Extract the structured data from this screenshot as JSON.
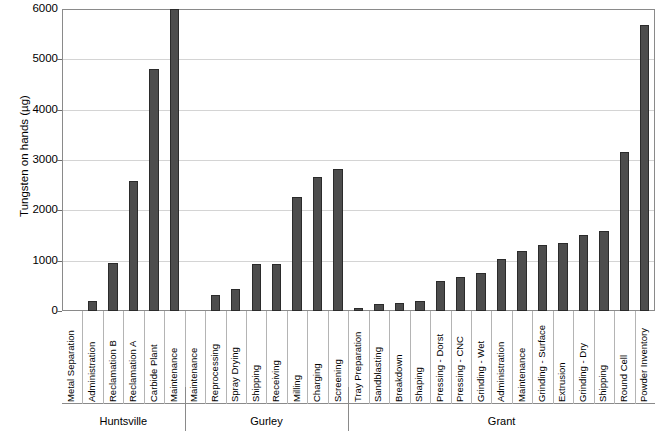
{
  "chart_data": {
    "type": "bar",
    "title": "",
    "xlabel": "",
    "ylabel": "Tungsten on hands (µg)",
    "ylim": [
      0,
      6000
    ],
    "ytick_labels": [
      "6000",
      "5000",
      "4000",
      "3000",
      "2000",
      "1000",
      "0"
    ],
    "ytick_values": [
      6000,
      5000,
      4000,
      3000,
      2000,
      1000,
      0
    ],
    "grid": true,
    "legend": "none",
    "bar_color": "#4d4d4d",
    "bar_edge_color": "#2b2b2b",
    "categories": [
      "Metal Separation",
      "Administration",
      "Reclamation B",
      "Reclamation A",
      "Carbide Plant",
      "Maintenance",
      "Maintenance",
      "Reprocessing",
      "Spray Drying",
      "Shipping",
      "Receiving",
      "Milling",
      "Charging",
      "Screening",
      "Tray Preparation",
      "Sandblasting",
      "Breakdown",
      "Shaping",
      "Pressing - Dorst",
      "Pressing - CNC",
      "Grinding - Wet",
      "Administration",
      "Maintenance",
      "Grinding - Surface",
      "Extrusion",
      "Grinding - Dry",
      "Shipping",
      "Round Cell",
      "Powder Inventory"
    ],
    "values": [
      0,
      200,
      950,
      2580,
      4800,
      6000,
      0,
      320,
      440,
      930,
      930,
      2270,
      2660,
      2820,
      60,
      130,
      150,
      200,
      590,
      680,
      760,
      1030,
      1200,
      1320,
      1360,
      1520,
      1590,
      3160,
      5680
    ],
    "groups": [
      {
        "label": "Huntsville",
        "start": 0,
        "count": 6
      },
      {
        "label": "Gurley",
        "start": 6,
        "count": 8
      },
      {
        "label": "Grant",
        "start": 14,
        "count": 15
      }
    ]
  }
}
